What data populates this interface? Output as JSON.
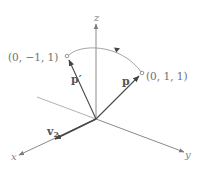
{
  "diagram": {
    "type": "3d-coordinate-rotation",
    "axes": {
      "x_label": "x",
      "y_label": "y",
      "z_label": "z"
    },
    "vectors": {
      "p_label": "p",
      "p_prime_label": "p′",
      "v2_label": "v",
      "v2_subscript": "2"
    },
    "points": {
      "p_coord": "(0, 1, 1)",
      "p_prime_coord": "(0, −1, 1)"
    },
    "colors": {
      "axis": "#8a8a8a",
      "vector": "#4a4a4a",
      "arc": "#9a9a9a",
      "text": "#6f6f6f"
    }
  }
}
